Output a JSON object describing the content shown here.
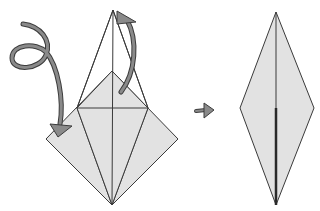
{
  "diagram": {
    "title": "Origami fold step: squash fold to kite diamond",
    "colors": {
      "background": "#ffffff",
      "paper_fill": "#e2e2e2",
      "line": "#3a3a3a",
      "arrow_fill": "#8a8a8a",
      "arrow_outline": "#3c3c3c"
    },
    "steps": [
      {
        "name": "before",
        "label": "Flaps folded behind / up"
      },
      {
        "name": "after",
        "label": "Resulting elongated diamond"
      }
    ],
    "arrows": [
      {
        "name": "loop-fold-arrow",
        "meaning": "fold behind (mountain fold)"
      },
      {
        "name": "fold-up-arrow",
        "meaning": "fold up"
      },
      {
        "name": "step-arrow",
        "meaning": "next step"
      }
    ]
  }
}
